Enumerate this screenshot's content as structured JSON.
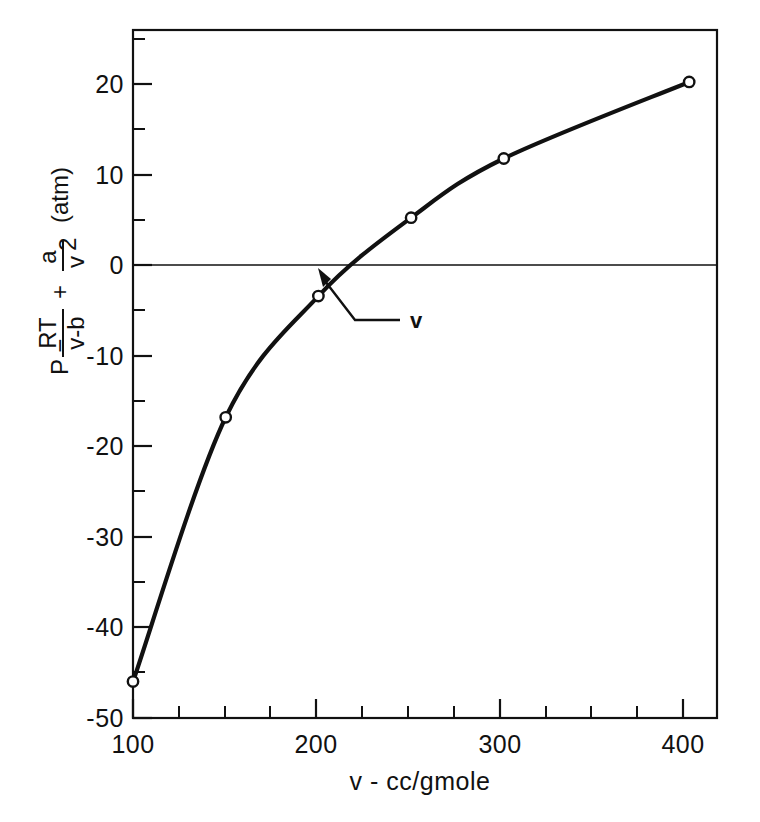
{
  "chart_data": {
    "type": "line",
    "title": "",
    "subtitle": "",
    "xlabel": "v - cc/gmole",
    "ylabel": "P - RT/(v-b) + a/v²  (atm)",
    "ylabel_parts": {
      "lead": "P −",
      "frac1_num": "RT",
      "frac1_den": "v-b",
      "plus": "+",
      "frac2_num": "a",
      "frac2_den": "v",
      "frac2_den_sup": "2",
      "units": "(atm)"
    },
    "xlim": [
      100,
      415
    ],
    "ylim": [
      -50,
      25.5
    ],
    "xticks_major": [
      100,
      200,
      300,
      400
    ],
    "xticks_major_labels": [
      "100",
      "200",
      "300",
      "400"
    ],
    "xticks_minor": [
      125,
      150,
      175,
      225,
      250,
      275,
      325,
      350,
      375
    ],
    "yticks_major": [
      -50,
      -40,
      -30,
      -20,
      -10,
      0,
      10,
      20
    ],
    "yticks_major_labels": [
      "-50",
      "-40",
      "-30",
      "-20",
      "-10",
      "0",
      "10",
      "20"
    ],
    "yticks_minor": [
      -45,
      -35,
      -25,
      -15,
      -5,
      5,
      15,
      25
    ],
    "grid": false,
    "legend": "none",
    "zero_line": 0,
    "series": [
      {
        "name": "P - RT/(v-b) + a/v^2",
        "x": [
          100,
          150,
          200,
          250,
          300,
          400
        ],
        "values": [
          -46.0,
          -17.0,
          -3.7,
          4.9,
          11.4,
          19.8
        ],
        "marker": "open-circle",
        "line": "solid"
      }
    ],
    "annotations": [
      {
        "label": "v",
        "target_x": 218,
        "target_y": 0,
        "description": "arrow pointing to the root where the curve crosses zero"
      }
    ]
  },
  "figure": {
    "background_color": "#ffffff",
    "line_color": "#111111",
    "marker_fill": "#ffffff"
  }
}
